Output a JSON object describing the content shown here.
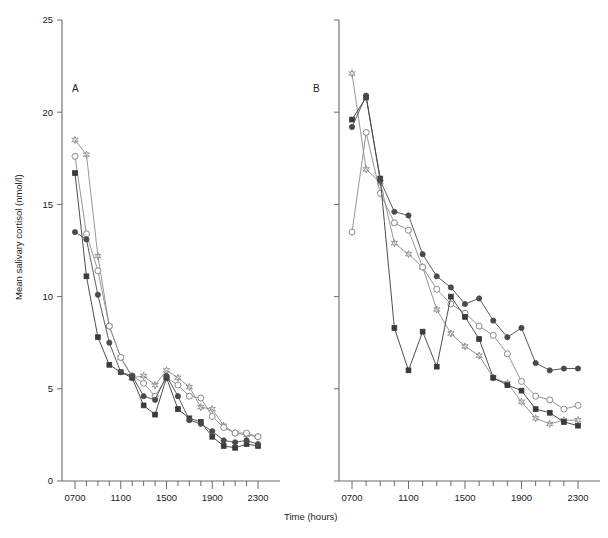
{
  "figure": {
    "panel_a_label": "A",
    "panel_b_label": "B",
    "y_axis_title": "Mean salivary cortisol (nmol/l)",
    "x_axis_title": "Time (hours)"
  },
  "chart_data": {
    "type": "line",
    "title": "",
    "xlabel": "Time (hours)",
    "ylabel": "Mean salivary cortisol (nmol/l)",
    "ylim": [
      0,
      25
    ],
    "xlim": [
      7,
      23
    ],
    "y_ticks": [
      0,
      5,
      10,
      15,
      20,
      25
    ],
    "y_tick_labels": [
      "0",
      "5",
      "10",
      "15",
      "20",
      "25"
    ],
    "x_ticks": [
      7,
      8,
      9,
      10,
      11,
      12,
      13,
      14,
      15,
      16,
      17,
      18,
      19,
      20,
      21,
      22,
      23
    ],
    "x_tick_labels": [
      "0700",
      "",
      "",
      "",
      "1100",
      "",
      "",
      "",
      "1500",
      "",
      "",
      "",
      "1900",
      "",
      "",
      "",
      "2300"
    ],
    "x_labelled_ticks": [
      7,
      11,
      15,
      19,
      23
    ],
    "grid": false,
    "legend": "none",
    "marker_colors": {
      "star": "#8a8a8a",
      "open-circle": "#8a8a8a",
      "filled-square": "#3a3a3a",
      "filled-circle": "#4a4a4a"
    },
    "panels": [
      {
        "id": "A",
        "label": "A",
        "series": [
          {
            "name": "star",
            "marker": "star",
            "x": [
              7,
              8,
              9,
              10,
              11,
              12,
              13,
              14,
              15,
              16,
              17,
              18,
              19,
              20,
              21,
              22,
              23
            ],
            "values": [
              18.5,
              17.7,
              12.2,
              8.4,
              6.7,
              5.6,
              5.7,
              5.2,
              6.0,
              5.6,
              5.1,
              4.0,
              3.9,
              3.0,
              2.6,
              2.5,
              2.4
            ]
          },
          {
            "name": "open-circle",
            "marker": "open-circle",
            "x": [
              7,
              8,
              9,
              10,
              11,
              12,
              13,
              14,
              15,
              16,
              17,
              18,
              19,
              20,
              21,
              22,
              23
            ],
            "values": [
              17.6,
              13.4,
              11.4,
              8.4,
              6.7,
              5.7,
              5.3,
              4.6,
              5.6,
              5.2,
              4.6,
              4.5,
              3.5,
              2.9,
              2.6,
              2.6,
              2.4
            ]
          },
          {
            "name": "filled-square",
            "marker": "filled-square",
            "x": [
              7,
              8,
              9,
              10,
              11,
              12,
              13,
              14,
              15,
              16,
              17,
              18,
              19,
              20,
              21,
              22,
              23
            ],
            "values": [
              16.7,
              11.1,
              7.8,
              6.3,
              5.9,
              5.6,
              4.1,
              3.6,
              5.6,
              3.9,
              3.4,
              3.2,
              2.4,
              1.9,
              1.8,
              2.0,
              1.9
            ]
          },
          {
            "name": "filled-circle",
            "marker": "filled-circle",
            "x": [
              7,
              8,
              9,
              10,
              11,
              12,
              13,
              14,
              15,
              16,
              17,
              18,
              19,
              20,
              21,
              22,
              23
            ],
            "values": [
              13.5,
              13.1,
              10.1,
              7.5,
              5.9,
              5.7,
              4.6,
              4.4,
              5.7,
              4.6,
              3.3,
              3.1,
              2.7,
              2.2,
              2.1,
              2.2,
              2.0
            ]
          }
        ]
      },
      {
        "id": "B",
        "label": "B",
        "series": [
          {
            "name": "star",
            "marker": "star",
            "x": [
              7,
              8,
              9,
              10,
              11,
              12,
              13,
              14,
              15,
              16,
              17,
              18,
              19,
              20,
              21,
              22,
              23
            ],
            "values": [
              22.1,
              16.9,
              16.2,
              12.9,
              12.3,
              11.6,
              9.3,
              8.0,
              7.3,
              6.8,
              5.6,
              5.3,
              4.3,
              3.4,
              3.1,
              3.3,
              3.3
            ]
          },
          {
            "name": "open-circle",
            "marker": "open-circle",
            "x": [
              7,
              8,
              9,
              10,
              11,
              12,
              13,
              14,
              15,
              16,
              17,
              18,
              19,
              20,
              21,
              22,
              23
            ],
            "values": [
              13.5,
              18.9,
              15.6,
              14.0,
              13.6,
              11.6,
              10.4,
              9.6,
              9.1,
              8.4,
              7.9,
              6.9,
              5.4,
              4.6,
              4.4,
              3.9,
              4.1
            ]
          },
          {
            "name": "filled-square",
            "marker": "filled-square",
            "x": [
              7,
              8,
              9,
              10,
              11,
              12,
              13,
              14,
              15,
              16,
              17,
              18,
              19,
              20,
              21,
              22,
              23
            ],
            "values": [
              19.6,
              20.8,
              16.4,
              8.3,
              6.0,
              8.1,
              6.2,
              10.0,
              8.9,
              7.7,
              5.6,
              5.2,
              4.9,
              3.9,
              3.7,
              3.2,
              3.0
            ]
          },
          {
            "name": "filled-circle",
            "marker": "filled-circle",
            "x": [
              7,
              8,
              9,
              10,
              11,
              12,
              13,
              14,
              15,
              16,
              17,
              18,
              19,
              20,
              21,
              22,
              23
            ],
            "values": [
              19.2,
              20.9,
              16.3,
              14.6,
              14.4,
              12.3,
              11.1,
              10.5,
              9.6,
              9.9,
              8.7,
              7.8,
              8.3,
              6.4,
              6.0,
              6.1,
              6.1
            ]
          }
        ]
      }
    ]
  }
}
